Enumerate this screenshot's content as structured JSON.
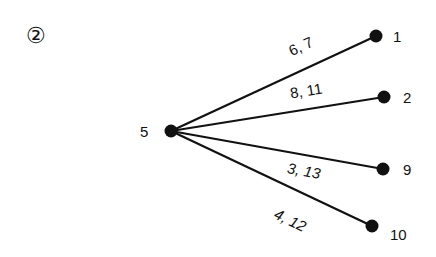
{
  "figure": {
    "marker": "②",
    "root": {
      "id": "5",
      "label": "5",
      "x": 171,
      "y": 131
    },
    "edges": [
      {
        "to": "1",
        "label": "6, 7",
        "node": {
          "label": "1",
          "x": 376,
          "y": 36
        },
        "label_pos": {
          "x": 303,
          "y": 51
        },
        "angle": -24.9,
        "italic": false,
        "node_label_pos": {
          "x": 393,
          "y": 42
        }
      },
      {
        "to": "2",
        "label": "8, 11",
        "node": {
          "label": "2",
          "x": 384,
          "y": 97
        },
        "label_pos": {
          "x": 307,
          "y": 96
        },
        "angle": -9.1,
        "italic": false,
        "node_label_pos": {
          "x": 403,
          "y": 103
        }
      },
      {
        "to": "9",
        "label": "3, 13",
        "node": {
          "label": "9",
          "x": 383,
          "y": 169
        },
        "label_pos": {
          "x": 303,
          "y": 176
        },
        "angle": 10.2,
        "italic": true,
        "node_label_pos": {
          "x": 403,
          "y": 175
        }
      },
      {
        "to": "10",
        "label": "4, 12",
        "node": {
          "label": "10",
          "x": 372,
          "y": 226
        },
        "label_pos": {
          "x": 288,
          "y": 225
        },
        "angle": 25.3,
        "italic": true,
        "node_label_pos": {
          "x": 390,
          "y": 240
        }
      }
    ],
    "colors": {
      "line": "#111111",
      "text": "#111111",
      "background": "#ffffff"
    }
  }
}
